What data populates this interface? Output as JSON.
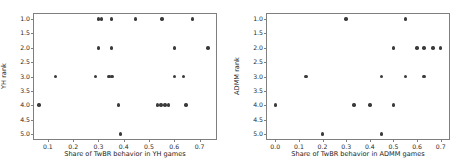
{
  "chart_data": [
    {
      "type": "scatter",
      "panel": "left",
      "title": "",
      "xlabel": "Share of TwBR behavior in YH games",
      "ylabel": "YH rank",
      "xlim": [
        0.045,
        0.765
      ],
      "ylim": [
        0.82,
        5.18
      ],
      "y_inverted": true,
      "grid": false,
      "legend": "none",
      "xticks": [
        0.1,
        0.2,
        0.3,
        0.4,
        0.5,
        0.6,
        0.7
      ],
      "xticklabels": [
        "0.1",
        "0.2",
        "0.3",
        "0.4",
        "0.5",
        "0.6",
        "0.7"
      ],
      "yticks": [
        1.0,
        1.5,
        2.0,
        2.5,
        3.0,
        3.5,
        4.0,
        4.5,
        5.0
      ],
      "yticklabels": [
        "1.0",
        "1.5",
        "2.0",
        "2.5",
        "3.0",
        "3.5",
        "4.0",
        "4.5",
        "5.0"
      ],
      "marker_color": "#3b3b3b",
      "points": [
        {
          "x": 0.3,
          "y": 1
        },
        {
          "x": 0.313,
          "y": 1
        },
        {
          "x": 0.352,
          "y": 1
        },
        {
          "x": 0.447,
          "y": 1
        },
        {
          "x": 0.551,
          "y": 1
        },
        {
          "x": 0.672,
          "y": 1
        },
        {
          "x": 0.299,
          "y": 2
        },
        {
          "x": 0.351,
          "y": 2
        },
        {
          "x": 0.6,
          "y": 2
        },
        {
          "x": 0.733,
          "y": 2
        },
        {
          "x": 0.13,
          "y": 3
        },
        {
          "x": 0.289,
          "y": 3
        },
        {
          "x": 0.341,
          "y": 3
        },
        {
          "x": 0.353,
          "y": 3
        },
        {
          "x": 0.6,
          "y": 3
        },
        {
          "x": 0.637,
          "y": 3
        },
        {
          "x": 0.065,
          "y": 4
        },
        {
          "x": 0.379,
          "y": 4
        },
        {
          "x": 0.533,
          "y": 4
        },
        {
          "x": 0.548,
          "y": 4
        },
        {
          "x": 0.563,
          "y": 4
        },
        {
          "x": 0.578,
          "y": 4
        },
        {
          "x": 0.647,
          "y": 4
        },
        {
          "x": 0.387,
          "y": 5
        }
      ]
    },
    {
      "type": "scatter",
      "panel": "right",
      "title": "",
      "xlabel": "Share of TwBR behavior in ADMM games",
      "ylabel": "ADMM rank",
      "xlim": [
        -0.035,
        0.735
      ],
      "ylim": [
        0.82,
        5.18
      ],
      "y_inverted": true,
      "grid": false,
      "legend": "none",
      "xticks": [
        0.0,
        0.1,
        0.2,
        0.3,
        0.4,
        0.5,
        0.6,
        0.7
      ],
      "xticklabels": [
        "0.0",
        "0.1",
        "0.2",
        "0.3",
        "0.4",
        "0.5",
        "0.6",
        "0.7"
      ],
      "yticks": [
        1.0,
        1.5,
        2.0,
        2.5,
        3.0,
        3.5,
        4.0,
        4.5,
        5.0
      ],
      "yticklabels": [
        "1.0",
        "1.5",
        "2.0",
        "2.5",
        "3.0",
        "3.5",
        "4.0",
        "4.5",
        "5.0"
      ],
      "marker_color": "#3b3b3b",
      "points": [
        {
          "x": 0.3,
          "y": 1
        },
        {
          "x": 0.55,
          "y": 1
        },
        {
          "x": 0.5,
          "y": 2
        },
        {
          "x": 0.6,
          "y": 2
        },
        {
          "x": 0.63,
          "y": 2
        },
        {
          "x": 0.667,
          "y": 2
        },
        {
          "x": 0.7,
          "y": 2
        },
        {
          "x": 0.13,
          "y": 3
        },
        {
          "x": 0.45,
          "y": 3
        },
        {
          "x": 0.55,
          "y": 3
        },
        {
          "x": 0.63,
          "y": 3
        },
        {
          "x": 0.0,
          "y": 4
        },
        {
          "x": 0.333,
          "y": 4
        },
        {
          "x": 0.4,
          "y": 4
        },
        {
          "x": 0.5,
          "y": 4
        },
        {
          "x": 0.2,
          "y": 5
        },
        {
          "x": 0.45,
          "y": 5
        }
      ]
    }
  ]
}
